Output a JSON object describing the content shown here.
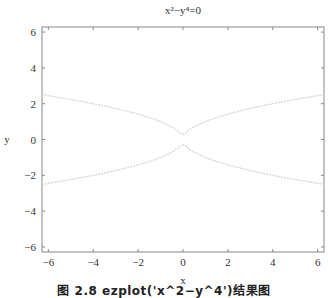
{
  "chart_data": {
    "type": "line",
    "title": "x²−y⁴=0",
    "xlabel": "x",
    "ylabel": "y",
    "xlim": [
      -6.2832,
      6.2832
    ],
    "ylim": [
      -6.2832,
      6.2832
    ],
    "xticks": [
      -6,
      -4,
      -2,
      0,
      2,
      4,
      6
    ],
    "yticks": [
      -6,
      -4,
      -2,
      0,
      2,
      4,
      6
    ],
    "grid": false,
    "legend": null,
    "series": [
      {
        "name": "y = sqrt(|x|)",
        "x": [
          -6.28,
          -5,
          -4,
          -3,
          -2,
          -1,
          -0.5,
          -0.1,
          0,
          0.1,
          0.5,
          1,
          2,
          3,
          4,
          5,
          6.28
        ],
        "y": [
          2.51,
          2.24,
          2.0,
          1.73,
          1.41,
          1.0,
          0.71,
          0.32,
          0.3,
          0.32,
          0.71,
          1.0,
          1.41,
          1.73,
          2.0,
          2.24,
          2.51
        ]
      },
      {
        "name": "y = -sqrt(|x|)",
        "x": [
          -6.28,
          -5,
          -4,
          -3,
          -2,
          -1,
          -0.5,
          -0.1,
          0,
          0.1,
          0.5,
          1,
          2,
          3,
          4,
          5,
          6.28
        ],
        "y": [
          -2.51,
          -2.24,
          -2.0,
          -1.73,
          -1.41,
          -1.0,
          -0.71,
          -0.32,
          -0.3,
          -0.32,
          -0.71,
          -1.0,
          -1.41,
          -1.73,
          -2.0,
          -2.24,
          -2.51
        ]
      }
    ],
    "line_color": "#d8d8d8"
  },
  "figure": {
    "caption": "图 2.8  ezplot('x^2−y^4')结果图"
  }
}
